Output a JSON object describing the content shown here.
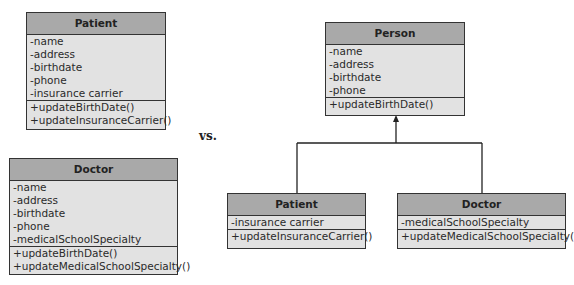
{
  "left_diagram": {
    "patient": {
      "name": "Patient",
      "attributes": [
        "-name",
        "-address",
        "-birthdate",
        "-phone",
        "-insurance carrier"
      ],
      "methods": [
        "+updateBirthDate()",
        "+updateInsuranceCarrier()"
      ]
    },
    "doctor": {
      "name": "Doctor",
      "attributes": [
        "-name",
        "-address",
        "-birthdate",
        "-phone",
        "-medicalSchoolSpecialty"
      ],
      "methods": [
        "+updateBirthDate()",
        "+updateMedicalSchoolSpecialty()"
      ]
    }
  },
  "separator": {
    "label": "vs."
  },
  "right_diagram": {
    "person": {
      "name": "Person",
      "attributes": [
        "-name",
        "-address",
        "-birthdate",
        "-phone"
      ],
      "methods": [
        "+updateBirthDate()"
      ]
    },
    "patient": {
      "name": "Patient",
      "attributes": [
        "-insurance carrier"
      ],
      "methods": [
        "+updateInsuranceCarrier()"
      ]
    },
    "doctor": {
      "name": "Doctor",
      "attributes": [
        "-medicalSchoolSpecialty"
      ],
      "methods": [
        "+updateMedicalSchoolSpecialty()"
      ]
    },
    "relationship": "generalization"
  },
  "colors": {
    "header": "#a9a9a9",
    "body": "#e2e2e2",
    "border": "#333333"
  }
}
